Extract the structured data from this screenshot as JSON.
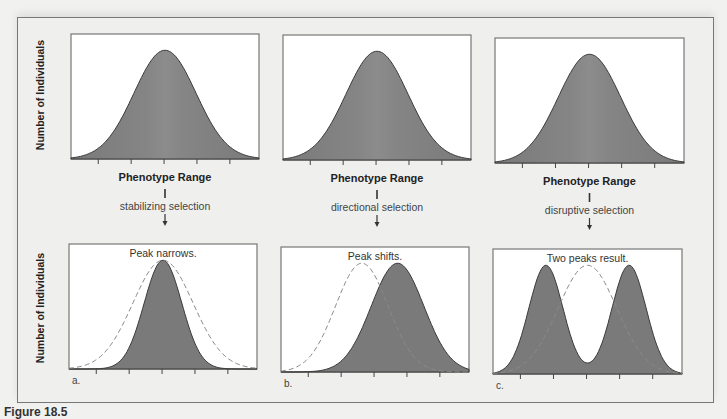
{
  "figure": {
    "caption": "Figure 18.5",
    "y_axis_label": "Number of Individuals",
    "x_axis_label": "Phenotype Range",
    "colors": {
      "fill": "#7a7a7a",
      "fill_center": "#858585",
      "outline": "#3a3a3a",
      "dashed": "#8a8a8a",
      "frame": "#777777",
      "plot_bg": "#ffffff",
      "page_bg": "#efefee"
    },
    "panels": [
      {
        "id": "a",
        "letter": "a.",
        "selection_type": "stabilizing selection",
        "result_label": "Peak narrows.",
        "top_plot": {
          "x": 71,
          "y": 34,
          "w": 188,
          "h": 125
        },
        "bottom_plot": {
          "x": 69,
          "y": 244,
          "w": 188,
          "h": 125
        }
      },
      {
        "id": "b",
        "letter": "b.",
        "selection_type": "directional selection",
        "result_label": "Peak shifts.",
        "top_plot": {
          "x": 283,
          "y": 35,
          "w": 188,
          "h": 125
        },
        "bottom_plot": {
          "x": 281,
          "y": 247,
          "w": 188,
          "h": 125
        }
      },
      {
        "id": "c",
        "letter": "c.",
        "selection_type": "disruptive selection",
        "result_label": "Two peaks result.",
        "top_plot": {
          "x": 495,
          "y": 38,
          "w": 189,
          "h": 125
        },
        "bottom_plot": {
          "x": 493,
          "y": 249,
          "w": 189,
          "h": 125
        }
      }
    ]
  },
  "chart_data": [
    {
      "type": "area",
      "title": "Stabilizing selection",
      "xlabel": "Phenotype Range",
      "ylabel": "Number of Individuals",
      "x_ticks": 5,
      "before": {
        "name": "Original population",
        "mean": 0.5,
        "sd": 0.16,
        "peak": 0.87
      },
      "after": {
        "name": "After selection",
        "mean": 0.5,
        "sd": 0.1,
        "peak": 0.87
      },
      "annotation": "Peak narrows."
    },
    {
      "type": "area",
      "title": "Directional selection",
      "xlabel": "Phenotype Range",
      "ylabel": "Number of Individuals",
      "x_ticks": 5,
      "before": {
        "name": "Original population",
        "mean": 0.45,
        "sd": 0.14,
        "peak": 0.87
      },
      "after": {
        "name": "After selection",
        "mean": 0.62,
        "sd": 0.14,
        "peak": 0.87
      },
      "annotation": "Peak shifts."
    },
    {
      "type": "area",
      "title": "Disruptive selection",
      "xlabel": "Phenotype Range",
      "ylabel": "Number of Individuals",
      "x_ticks": 5,
      "before": {
        "name": "Original population",
        "mean": 0.5,
        "sd": 0.155,
        "peak": 0.87
      },
      "after": {
        "name": "After selection",
        "modes": [
          0.29,
          0.71
        ],
        "sd": 0.09,
        "peak": 0.87,
        "trough": 0.25
      },
      "annotation": "Two peaks result."
    }
  ]
}
